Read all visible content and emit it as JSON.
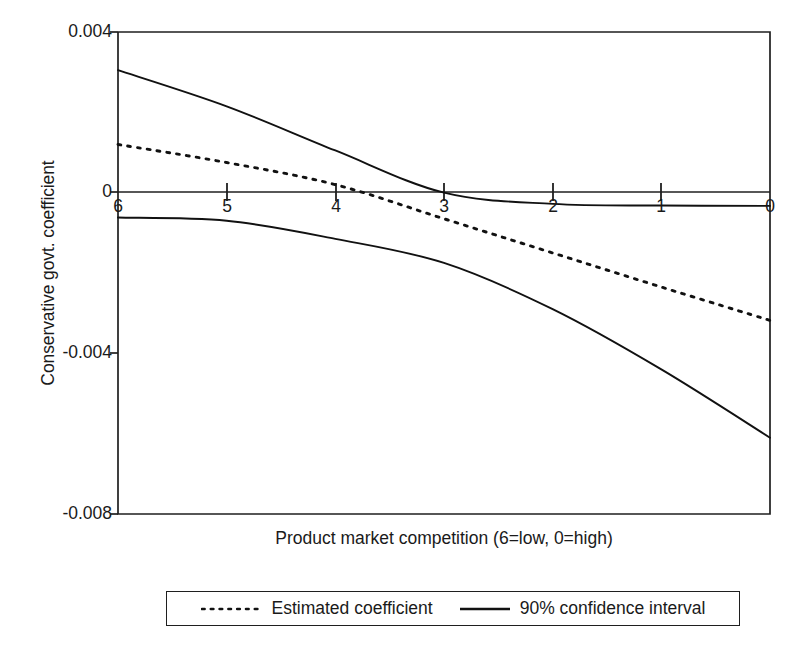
{
  "chart_data": {
    "type": "line",
    "title": "",
    "xlabel": "Product market competition (6=low, 0=high)",
    "ylabel": "Conservative govt. coefficient",
    "xlim": [
      6,
      0
    ],
    "ylim": [
      -0.008,
      0.004
    ],
    "x_ticks": [
      6,
      5,
      4,
      3,
      2,
      1,
      0
    ],
    "x_tick_labels": [
      "6",
      "5",
      "4",
      "3",
      "2",
      "1",
      "0"
    ],
    "y_ticks": [
      0.004,
      0,
      -0.004,
      -0.008
    ],
    "y_tick_labels": [
      "0.004",
      "0",
      "-0.004",
      "-0.008"
    ],
    "grid": false,
    "zero_line": true,
    "legend_position": "below-plot",
    "x_axis_direction": "decreasing",
    "series": [
      {
        "name": "Estimated coefficient",
        "style": "dotted",
        "color": "#111111",
        "x": [
          6,
          5,
          4,
          3,
          2,
          1,
          0
        ],
        "values": [
          0.0012,
          0.00075,
          0.0002,
          -0.00065,
          -0.0015,
          -0.00235,
          -0.00318
        ]
      },
      {
        "name": "90% confidence interval (upper)",
        "style": "solid",
        "color": "#111111",
        "x": [
          6,
          5,
          4,
          3,
          2,
          1,
          0
        ],
        "values": [
          0.00305,
          0.00215,
          0.00105,
          0.0,
          -0.00028,
          -0.00032,
          -0.00033
        ]
      },
      {
        "name": "90% confidence interval (lower)",
        "style": "solid",
        "color": "#111111",
        "x": [
          6,
          5,
          4,
          3,
          2,
          1,
          0
        ],
        "values": [
          -0.00062,
          -0.0007,
          -0.00115,
          -0.00175,
          -0.0029,
          -0.0044,
          -0.0061
        ]
      }
    ],
    "legend": [
      {
        "label": "Estimated coefficient",
        "style": "dotted"
      },
      {
        "label": "90% confidence interval",
        "style": "solid"
      }
    ],
    "annotations": []
  },
  "axes": {
    "y_title": "Conservative govt. coefficient",
    "x_title": "Product market competition (6=low, 0=high)",
    "y_tick_labels": [
      "0.004",
      "0",
      "-0.004",
      "-0.008"
    ],
    "x_tick_labels": [
      "6",
      "5",
      "4",
      "3",
      "2",
      "1",
      "0"
    ]
  },
  "legend": {
    "estimated_label": "Estimated coefficient",
    "confidence_label": "90% confidence interval"
  },
  "style": {
    "line_color": "#111111",
    "frame_color": "#1f1f1f",
    "background": "#ffffff"
  }
}
